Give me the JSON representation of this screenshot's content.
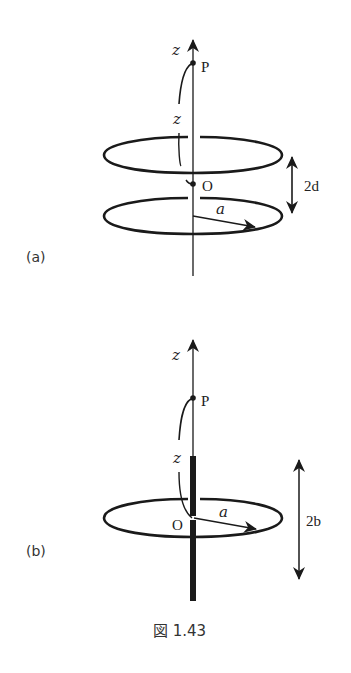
{
  "figure": {
    "caption": "図 1.43",
    "panels": [
      {
        "id": "a",
        "label": "(a)",
        "axis_label": "z",
        "point_P": "P",
        "distance_label": "z",
        "origin_label": "O",
        "radius_label": "a",
        "separation_label": "2d",
        "description": "Two coaxial rings of radius a separated by 2d, point P on axis at distance z from midpoint O"
      },
      {
        "id": "b",
        "label": "(b)",
        "axis_label": "z",
        "point_P": "P",
        "distance_label": "z",
        "origin_label": "O",
        "radius_label": "a",
        "length_label": "2b",
        "description": "Ring of radius a with a thick rod of length 2b along the axis centered at O, point P on axis at distance z"
      }
    ]
  },
  "colors": {
    "ink": "#1a1a1a",
    "background": "#ffffff"
  }
}
